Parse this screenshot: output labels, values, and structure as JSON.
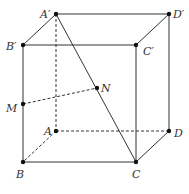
{
  "diagram": {
    "type": "cube",
    "labels": {
      "A1": "A′",
      "D1": "D′",
      "B1": "B′",
      "C1": "C′",
      "A": "A",
      "D": "D",
      "B": "B",
      "C": "C",
      "M": "M",
      "N": "N"
    },
    "colors": {
      "line": "#333333",
      "point": "#111111"
    }
  }
}
